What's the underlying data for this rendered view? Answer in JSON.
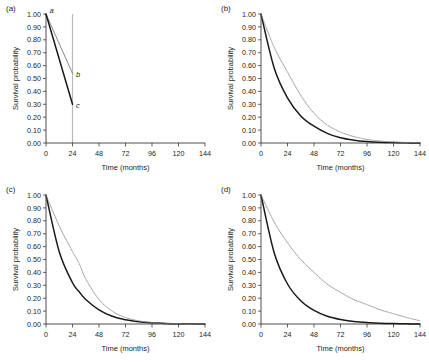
{
  "figure": {
    "background": "#ffffff",
    "axis_color": "#231f20",
    "solid_color": "#1a1a1a",
    "dotted_color": "#8c8c8c",
    "reference_line_color": "#b9b9b9"
  },
  "axes": {
    "xlabel": "Time (months)",
    "ylabel": "Survival probability",
    "xticks": [
      "0",
      "24",
      "48",
      "72",
      "96",
      "120",
      "144"
    ],
    "xtick_values": [
      0,
      24,
      48,
      72,
      96,
      120,
      144
    ],
    "yticks": [
      "0.00",
      "0.10",
      "0.20",
      "0.30",
      "0.40",
      "0.50",
      "0.60",
      "0.70",
      "0.80",
      "0.90",
      "1.00"
    ],
    "ytick_values": [
      0.0,
      0.1,
      0.2,
      0.3,
      0.4,
      0.5,
      0.6,
      0.7,
      0.8,
      0.9,
      1.0
    ],
    "xlim": [
      0,
      144
    ],
    "ylim": [
      0,
      1
    ],
    "grid": false,
    "legend": "none"
  },
  "panels": [
    {
      "id": "a",
      "label": "(a)"
    },
    {
      "id": "b",
      "label": "(b)"
    },
    {
      "id": "c",
      "label": "(c)"
    },
    {
      "id": "d",
      "label": "(d)"
    }
  ],
  "annotations": {
    "a_point": "a",
    "b_point": "b",
    "c_point": "c"
  },
  "chart_data": [
    {
      "type": "line",
      "panel": "(a)",
      "title": "",
      "xlabel": "Time (months)",
      "ylabel": "Survival probability",
      "xlim": [
        0,
        144
      ],
      "ylim": [
        0,
        1
      ],
      "grid": false,
      "annotations": [
        {
          "text": "a",
          "x": 0,
          "y": 1.0
        },
        {
          "text": "b",
          "x": 24,
          "y": 0.54
        },
        {
          "text": "c",
          "x": 24,
          "y": 0.3
        }
      ],
      "reference_lines": [
        {
          "orientation": "vertical",
          "x": 24,
          "color": "#b9b9b9"
        }
      ],
      "series": [
        {
          "name": "upper-segment",
          "style": "thin-gray",
          "x": [
            0,
            24
          ],
          "values": [
            1.0,
            0.54
          ]
        },
        {
          "name": "lower-segment",
          "style": "solid",
          "x": [
            0,
            24
          ],
          "values": [
            1.0,
            0.3
          ]
        }
      ]
    },
    {
      "type": "line",
      "panel": "(b)",
      "title": "",
      "xlabel": "Time (months)",
      "ylabel": "Survival probability",
      "xlim": [
        0,
        144
      ],
      "ylim": [
        0,
        1
      ],
      "grid": false,
      "x": [
        0,
        12,
        24,
        36,
        48,
        60,
        72,
        84,
        96,
        108,
        120,
        132,
        144
      ],
      "series": [
        {
          "name": "solid-curve",
          "style": "solid",
          "values": [
            1.0,
            0.58,
            0.35,
            0.21,
            0.13,
            0.075,
            0.04,
            0.022,
            0.012,
            0.006,
            0.003,
            0.001,
            0.0
          ]
        },
        {
          "name": "dotted-curve",
          "style": "dotted",
          "values": [
            1.0,
            0.74,
            0.55,
            0.37,
            0.23,
            0.14,
            0.085,
            0.05,
            0.028,
            0.015,
            0.008,
            0.004,
            0.002
          ]
        }
      ]
    },
    {
      "type": "line",
      "panel": "(c)",
      "title": "",
      "xlabel": "Time (months)",
      "ylabel": "Survival probability",
      "xlim": [
        0,
        144
      ],
      "ylim": [
        0,
        1
      ],
      "grid": false,
      "x": [
        0,
        12,
        24,
        30,
        36,
        48,
        60,
        72,
        84,
        96,
        108,
        120,
        132,
        144
      ],
      "series": [
        {
          "name": "solid-curve",
          "style": "solid",
          "values": [
            1.0,
            0.56,
            0.32,
            0.25,
            0.19,
            0.11,
            0.06,
            0.033,
            0.017,
            0.009,
            0.004,
            0.002,
            0.001,
            0.0
          ]
        },
        {
          "name": "dotted-curve",
          "style": "dotted",
          "values": [
            1.0,
            0.76,
            0.56,
            0.47,
            0.35,
            0.19,
            0.1,
            0.05,
            0.025,
            0.012,
            0.006,
            0.003,
            0.001,
            0.0
          ]
        }
      ]
    },
    {
      "type": "line",
      "panel": "(d)",
      "title": "",
      "xlabel": "Time (months)",
      "ylabel": "Survival probability",
      "xlim": [
        0,
        144
      ],
      "ylim": [
        0,
        1
      ],
      "grid": false,
      "x": [
        0,
        12,
        24,
        36,
        48,
        60,
        72,
        84,
        96,
        108,
        120,
        132,
        144
      ],
      "series": [
        {
          "name": "solid-curve",
          "style": "solid",
          "values": [
            1.0,
            0.55,
            0.31,
            0.18,
            0.105,
            0.06,
            0.035,
            0.02,
            0.011,
            0.006,
            0.003,
            0.001,
            0.0
          ]
        },
        {
          "name": "dotted-curve",
          "style": "dotted",
          "values": [
            1.0,
            0.79,
            0.63,
            0.5,
            0.4,
            0.31,
            0.245,
            0.19,
            0.15,
            0.11,
            0.08,
            0.05,
            0.025
          ]
        }
      ]
    }
  ]
}
